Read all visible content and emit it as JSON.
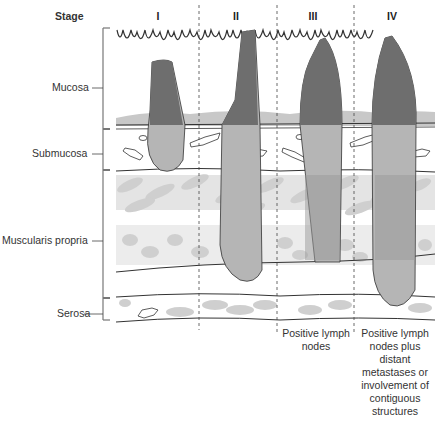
{
  "header": {
    "stage_label": "Stage"
  },
  "stages": [
    {
      "label": "I",
      "x": 158
    },
    {
      "label": "II",
      "x": 236
    },
    {
      "label": "III",
      "x": 313
    },
    {
      "label": "IV",
      "x": 392
    }
  ],
  "layers": [
    {
      "label": "Mucosa",
      "y": 82
    },
    {
      "label": "Submucosa",
      "y": 148
    },
    {
      "label": "Muscularis propria",
      "y": 235
    },
    {
      "label": "Serosa",
      "y": 308
    }
  ],
  "notes": {
    "stage_III": "Positive lymph nodes",
    "stage_IV": "Positive lymph nodes plus distant metastases or involvement of contiguous structures"
  },
  "colors": {
    "tumor_dark": "#6e6e6e",
    "tumor_light": "#b5b5b5",
    "tissue_gray": "#c8c8c8",
    "muscle_light": "#d4d4d4",
    "muscle_dark": "#9a9a9a",
    "line": "#333333"
  }
}
